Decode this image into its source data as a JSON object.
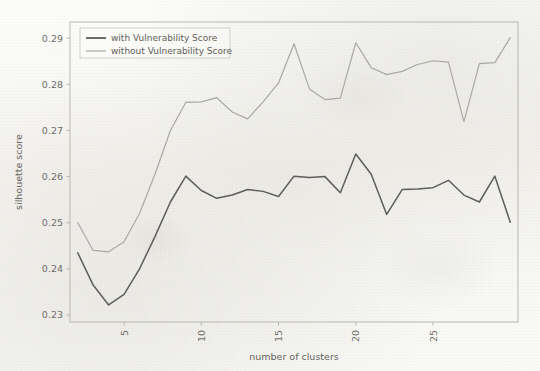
{
  "chart_data": {
    "type": "line",
    "title": "",
    "xlabel": "number of clusters",
    "ylabel": "silhouette score",
    "xlim": [
      1.5,
      30.5
    ],
    "ylim": [
      0.2285,
      0.2935
    ],
    "xticks": [
      5,
      10,
      15,
      20,
      25
    ],
    "xtick_labels": [
      "5",
      "10",
      "15",
      "20",
      "25"
    ],
    "xtick_rotation": 90,
    "yticks": [
      0.23,
      0.24,
      0.25,
      0.26,
      0.27,
      0.28,
      0.29
    ],
    "ytick_labels": [
      "0.23",
      "0.24",
      "0.25",
      "0.26",
      "0.27",
      "0.28",
      "0.29"
    ],
    "grid": false,
    "legend_position": "upper left",
    "x": [
      2,
      3,
      4,
      5,
      6,
      7,
      8,
      9,
      10,
      11,
      12,
      13,
      14,
      15,
      16,
      17,
      18,
      19,
      20,
      21,
      22,
      23,
      24,
      25,
      26,
      27,
      28,
      29,
      30
    ],
    "series": [
      {
        "name": "with Vulnerability Score",
        "color": "#5d5d5d",
        "values": [
          0.2435,
          0.2365,
          0.2322,
          0.2345,
          0.24,
          0.247,
          0.2545,
          0.2601,
          0.257,
          0.2553,
          0.256,
          0.2572,
          0.2568,
          0.2557,
          0.2601,
          0.2598,
          0.26,
          0.2565,
          0.2649,
          0.2605,
          0.2518,
          0.2572,
          0.2573,
          0.2576,
          0.2592,
          0.256,
          0.2545,
          0.2601,
          0.2501
        ]
      },
      {
        "name": "without Vulnerability Score",
        "color": "#a9a8a4",
        "values": [
          0.25,
          0.244,
          0.2437,
          0.2459,
          0.252,
          0.2605,
          0.27,
          0.2761,
          0.2762,
          0.2771,
          0.274,
          0.2725,
          0.2762,
          0.2803,
          0.2888,
          0.279,
          0.2767,
          0.277,
          0.289,
          0.2836,
          0.2821,
          0.2828,
          0.2843,
          0.2851,
          0.2848,
          0.2719,
          0.2845,
          0.2847,
          0.2901
        ]
      }
    ],
    "legend": [
      {
        "label": "with Vulnerability Score",
        "color": "#5d5d5d"
      },
      {
        "label": "without Vulnerability Score",
        "color": "#a9a8a4"
      }
    ]
  }
}
